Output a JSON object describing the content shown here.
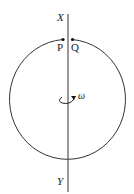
{
  "diagram": {
    "axis_top_label": "X",
    "axis_bottom_label": "Y",
    "point_left_label": "P",
    "point_right_label": "Q",
    "angular_velocity_label": "ω",
    "colors": {
      "stroke": "#333333",
      "background": "#ffffff"
    }
  }
}
